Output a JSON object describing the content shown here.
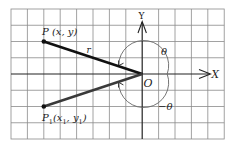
{
  "diagram": {
    "type": "polar-coordinate-angle-diagram",
    "axes": {
      "x_label": "X",
      "y_label": "Y",
      "origin_label": "O"
    },
    "points": [
      {
        "id": "P",
        "label": "P (x, y)",
        "grid": [
          -6,
          2
        ]
      },
      {
        "id": "P1",
        "label": "P₁(x₁, y₁)",
        "grid": [
          -6,
          -2
        ]
      }
    ],
    "segments": [
      {
        "from": "O",
        "to": "P",
        "label": "r",
        "color": "#111111"
      },
      {
        "from": "O",
        "to": "P1",
        "label": "",
        "color": "#3a3a3a"
      }
    ],
    "angles": [
      {
        "label": "θ",
        "direction": "counterclockwise",
        "from": "positive-x-axis",
        "to": "OP"
      },
      {
        "label": "−θ",
        "direction": "clockwise",
        "from": "positive-x-axis",
        "to": "OP1"
      }
    ],
    "grid": {
      "columns": 13,
      "rows": 8,
      "color": "#808080"
    }
  },
  "labels": {
    "P": "P (x, y)",
    "P1_main": "P",
    "P1_sub": "1",
    "P1_rest_a": "(x",
    "P1_rest_b": ", y",
    "P1_rest_c": ")",
    "r": "r",
    "theta": "θ",
    "neg_theta": "−θ",
    "origin": "O",
    "x_axis": "X",
    "y_axis": "Y"
  }
}
